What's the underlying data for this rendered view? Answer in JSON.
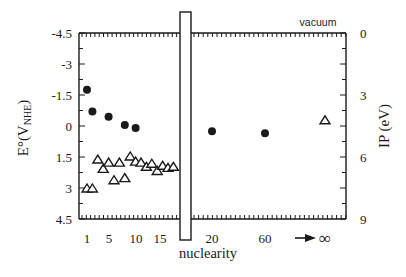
{
  "chart_data": {
    "type": "scatter",
    "title": "",
    "xlabel": "nuclearity",
    "ylabel_left": "E°(V_NHE)",
    "ylabel_left_main": "E°(V",
    "ylabel_left_sub": "NHE",
    "ylabel_left_close": ")",
    "ylabel_right": "IP (eV)",
    "annotation_top": "vacuum",
    "left_axis": {
      "ticks": [
        "-4.5",
        "-3",
        "-1.5",
        "0",
        "1.5",
        "3",
        "4.5"
      ],
      "values": [
        -4.5,
        -3,
        -1.5,
        0,
        1.5,
        3,
        4.5
      ],
      "range": [
        -4.5,
        4.5
      ],
      "inverted": true
    },
    "right_axis": {
      "ticks": [
        "0",
        "3",
        "6",
        "9"
      ],
      "values": [
        0,
        3,
        6,
        9
      ],
      "range": [
        0,
        9
      ]
    },
    "x_ticks_left": [
      "1",
      "5",
      "10",
      "15"
    ],
    "x_ticks_right": [
      "20",
      "60"
    ],
    "x_infinity_label": "∞",
    "axis_break": true,
    "legend": [],
    "series": [
      {
        "name": "filled circles (E°)",
        "marker": "circle-filled",
        "points": [
          {
            "x": 1,
            "y": -1.75
          },
          {
            "x": 2,
            "y": -0.7
          },
          {
            "x": 5,
            "y": -0.45
          },
          {
            "x": 8,
            "y": -0.05
          },
          {
            "x": 10,
            "y": 0.1
          },
          {
            "x": 20,
            "y": 0.25
          },
          {
            "x": 60,
            "y": 0.35
          }
        ]
      },
      {
        "name": "open triangles (E°)",
        "marker": "triangle-open",
        "points": [
          {
            "x": 1,
            "y": 3.0
          },
          {
            "x": 2,
            "y": 3.0
          },
          {
            "x": 3,
            "y": 1.6
          },
          {
            "x": 4,
            "y": 2.05
          },
          {
            "x": 5,
            "y": 1.75
          },
          {
            "x": 6,
            "y": 2.6
          },
          {
            "x": 7,
            "y": 1.75
          },
          {
            "x": 8,
            "y": 2.5
          },
          {
            "x": 9,
            "y": 1.45
          },
          {
            "x": 10,
            "y": 1.7
          },
          {
            "x": 11,
            "y": 1.75
          },
          {
            "x": 12,
            "y": 1.95
          },
          {
            "x": 13,
            "y": 1.8
          },
          {
            "x": 14,
            "y": 2.15
          },
          {
            "x": 15,
            "y": 1.9
          },
          {
            "x": 16,
            "y": 2.0
          },
          {
            "x": 17,
            "y": 1.95
          },
          {
            "x": "∞",
            "y": -0.3
          }
        ]
      }
    ]
  }
}
